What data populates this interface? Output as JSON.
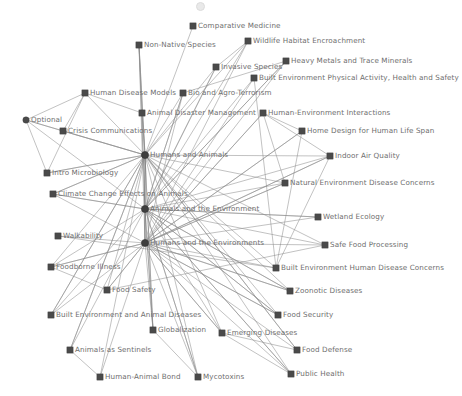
{
  "figure": {
    "type": "node-link-network-graph",
    "background_color": "#ffffff",
    "edge_color": "#8a8a8a",
    "node_color": "#4a4a4a",
    "label_color": "#6e6e6e",
    "width": 462,
    "height": 396
  },
  "chart_data": {
    "type": "network",
    "title": "",
    "hub_nodes": [
      "Humans and Animals",
      "Animals and the Environment",
      "Humans and the Environments"
    ],
    "nodes": [
      {
        "id": "comparative-medicine",
        "label": "Comparative Medicine",
        "x": 193,
        "y": 26,
        "shape": "square",
        "anchor": "right"
      },
      {
        "id": "non-native-species",
        "label": "Non-Native Species",
        "x": 139,
        "y": 45,
        "shape": "square",
        "anchor": "right"
      },
      {
        "id": "wildlife-habitat-encroachment",
        "label": "Wildlife Habitat Encroachment",
        "x": 248,
        "y": 41,
        "shape": "square",
        "anchor": "right"
      },
      {
        "id": "heavy-metals-trace-minerals",
        "label": "Heavy Metals and Trace Minerals",
        "x": 286,
        "y": 61,
        "shape": "square",
        "anchor": "right"
      },
      {
        "id": "invasive-species",
        "label": "Invasive Species",
        "x": 216,
        "y": 67,
        "shape": "square",
        "anchor": "right"
      },
      {
        "id": "built-env-physical-activity",
        "label": "Built Environment Physical Activity, Health and Safety",
        "x": 254,
        "y": 78,
        "shape": "square",
        "anchor": "right"
      },
      {
        "id": "human-disease-models",
        "label": "Human Disease Models",
        "x": 85,
        "y": 93,
        "shape": "square",
        "anchor": "right"
      },
      {
        "id": "bio-agro-terrorism",
        "label": "Bio and Agro-Terrorism",
        "x": 183,
        "y": 93,
        "shape": "square",
        "anchor": "right"
      },
      {
        "id": "animal-disaster-management",
        "label": "Animal Disaster Management",
        "x": 142,
        "y": 113,
        "shape": "square",
        "anchor": "right"
      },
      {
        "id": "human-environment-interactions",
        "label": "Human-Environment Interactions",
        "x": 263,
        "y": 113,
        "shape": "square",
        "anchor": "right"
      },
      {
        "id": "optional",
        "label": "Optional",
        "x": 26,
        "y": 120,
        "shape": "circle",
        "anchor": "right"
      },
      {
        "id": "crisis-communications",
        "label": "Crisis Communications",
        "x": 63,
        "y": 131,
        "shape": "square",
        "anchor": "right"
      },
      {
        "id": "home-design-human-life-span",
        "label": "Home Design for Human Life Span",
        "x": 302,
        "y": 131,
        "shape": "square",
        "anchor": "right"
      },
      {
        "id": "humans-and-animals",
        "label": "Humans and Animals",
        "x": 145,
        "y": 155,
        "shape": "hub",
        "anchor": "right"
      },
      {
        "id": "indoor-air-quality",
        "label": "Indoor Air Quality",
        "x": 330,
        "y": 156,
        "shape": "square",
        "anchor": "right"
      },
      {
        "id": "intro-microbiology",
        "label": "Intro Microbiology",
        "x": 47,
        "y": 173,
        "shape": "square",
        "anchor": "right"
      },
      {
        "id": "natural-env-disease-concerns",
        "label": "Natural Environment Disease Concerns",
        "x": 285,
        "y": 183,
        "shape": "square",
        "anchor": "right"
      },
      {
        "id": "climate-change-effects-animals",
        "label": "Climate Change Effects on Animals",
        "x": 53,
        "y": 194,
        "shape": "square",
        "anchor": "right"
      },
      {
        "id": "animals-and-the-environment",
        "label": "Animals and the Environment",
        "x": 145,
        "y": 209,
        "shape": "hub",
        "anchor": "right"
      },
      {
        "id": "wetland-ecology",
        "label": "Wetland Ecology",
        "x": 318,
        "y": 217,
        "shape": "square",
        "anchor": "right"
      },
      {
        "id": "walkability",
        "label": "Walkability",
        "x": 58,
        "y": 236,
        "shape": "square",
        "anchor": "right"
      },
      {
        "id": "humans-and-the-environments",
        "label": "Humans and the Environments",
        "x": 145,
        "y": 243,
        "shape": "hub",
        "anchor": "right"
      },
      {
        "id": "safe-food-processing",
        "label": "Safe Food Processing",
        "x": 325,
        "y": 245,
        "shape": "square",
        "anchor": "right"
      },
      {
        "id": "foodborne-illness",
        "label": "Foodborne Illness",
        "x": 51,
        "y": 267,
        "shape": "square",
        "anchor": "right"
      },
      {
        "id": "built-env-human-disease-concerns",
        "label": "Built Environment Human Disease Concerns",
        "x": 276,
        "y": 268,
        "shape": "square",
        "anchor": "right"
      },
      {
        "id": "food-safety",
        "label": "Food Safety",
        "x": 107,
        "y": 290,
        "shape": "square",
        "anchor": "right"
      },
      {
        "id": "zoonotic-diseases",
        "label": "Zoonotic Diseases",
        "x": 290,
        "y": 291,
        "shape": "square",
        "anchor": "right"
      },
      {
        "id": "built-env-animal-diseases",
        "label": "Built Environment and Animal Diseases",
        "x": 51,
        "y": 315,
        "shape": "square",
        "anchor": "right"
      },
      {
        "id": "food-security",
        "label": "Food Security",
        "x": 278,
        "y": 315,
        "shape": "square",
        "anchor": "right"
      },
      {
        "id": "globalization",
        "label": "Globalization",
        "x": 153,
        "y": 330,
        "shape": "square",
        "anchor": "right"
      },
      {
        "id": "emerging-diseases",
        "label": "Emerging Diseases",
        "x": 222,
        "y": 333,
        "shape": "square",
        "anchor": "right"
      },
      {
        "id": "food-defense",
        "label": "Food Defense",
        "x": 297,
        "y": 350,
        "shape": "square",
        "anchor": "right"
      },
      {
        "id": "animals-as-sentinels",
        "label": "Animals as Sentinels",
        "x": 70,
        "y": 350,
        "shape": "square",
        "anchor": "right"
      },
      {
        "id": "public-health",
        "label": "Public Health",
        "x": 291,
        "y": 374,
        "shape": "square",
        "anchor": "right"
      },
      {
        "id": "human-animal-bond",
        "label": "Human-Animal Bond",
        "x": 100,
        "y": 377,
        "shape": "square",
        "anchor": "right"
      },
      {
        "id": "mycotoxins",
        "label": "Mycotoxins",
        "x": 198,
        "y": 377,
        "shape": "square",
        "anchor": "right"
      }
    ],
    "edges": [
      [
        "humans-and-animals",
        "comparative-medicine"
      ],
      [
        "humans-and-animals",
        "non-native-species"
      ],
      [
        "humans-and-animals",
        "wildlife-habitat-encroachment"
      ],
      [
        "humans-and-animals",
        "invasive-species"
      ],
      [
        "humans-and-animals",
        "bio-agro-terrorism"
      ],
      [
        "humans-and-animals",
        "animal-disaster-management"
      ],
      [
        "humans-and-animals",
        "human-disease-models"
      ],
      [
        "humans-and-animals",
        "crisis-communications"
      ],
      [
        "humans-and-animals",
        "intro-microbiology"
      ],
      [
        "humans-and-animals",
        "climate-change-effects-animals"
      ],
      [
        "humans-and-animals",
        "zoonotic-diseases"
      ],
      [
        "humans-and-animals",
        "emerging-diseases"
      ],
      [
        "humans-and-animals",
        "public-health"
      ],
      [
        "humans-and-animals",
        "food-safety"
      ],
      [
        "humans-and-animals",
        "food-security"
      ],
      [
        "humans-and-animals",
        "food-defense"
      ],
      [
        "humans-and-animals",
        "animals-as-sentinels"
      ],
      [
        "humans-and-animals",
        "human-animal-bond"
      ],
      [
        "humans-and-animals",
        "mycotoxins"
      ],
      [
        "humans-and-animals",
        "globalization"
      ],
      [
        "humans-and-animals",
        "foodborne-illness"
      ],
      [
        "humans-and-animals",
        "safe-food-processing"
      ],
      [
        "humans-and-animals",
        "built-env-animal-diseases"
      ],
      [
        "animals-and-the-environment",
        "non-native-species"
      ],
      [
        "animals-and-the-environment",
        "invasive-species"
      ],
      [
        "animals-and-the-environment",
        "wildlife-habitat-encroachment"
      ],
      [
        "animals-and-the-environment",
        "heavy-metals-trace-minerals"
      ],
      [
        "animals-and-the-environment",
        "climate-change-effects-animals"
      ],
      [
        "animals-and-the-environment",
        "wetland-ecology"
      ],
      [
        "animals-and-the-environment",
        "natural-env-disease-concerns"
      ],
      [
        "animals-and-the-environment",
        "built-env-animal-diseases"
      ],
      [
        "animals-and-the-environment",
        "animals-as-sentinels"
      ],
      [
        "animals-and-the-environment",
        "globalization"
      ],
      [
        "animals-and-the-environment",
        "emerging-diseases"
      ],
      [
        "animals-and-the-environment",
        "zoonotic-diseases"
      ],
      [
        "animals-and-the-environment",
        "public-health"
      ],
      [
        "animals-and-the-environment",
        "food-security"
      ],
      [
        "animals-and-the-environment",
        "mycotoxins"
      ],
      [
        "animals-and-the-environment",
        "safe-food-processing"
      ],
      [
        "animals-and-the-environment",
        "bio-agro-terrorism"
      ],
      [
        "humans-and-the-environments",
        "human-environment-interactions"
      ],
      [
        "humans-and-the-environments",
        "home-design-human-life-span"
      ],
      [
        "humans-and-the-environments",
        "indoor-air-quality"
      ],
      [
        "humans-and-the-environments",
        "natural-env-disease-concerns"
      ],
      [
        "humans-and-the-environments",
        "built-env-physical-activity"
      ],
      [
        "humans-and-the-environments",
        "built-env-human-disease-concerns"
      ],
      [
        "humans-and-the-environments",
        "walkability"
      ],
      [
        "humans-and-the-environments",
        "foodborne-illness"
      ],
      [
        "humans-and-the-environments",
        "food-safety"
      ],
      [
        "humans-and-the-environments",
        "built-env-animal-diseases"
      ],
      [
        "humans-and-the-environments",
        "globalization"
      ],
      [
        "humans-and-the-environments",
        "emerging-diseases"
      ],
      [
        "humans-and-the-environments",
        "food-security"
      ],
      [
        "humans-and-the-environments",
        "food-defense"
      ],
      [
        "humans-and-the-environments",
        "public-health"
      ],
      [
        "humans-and-the-environments",
        "safe-food-processing"
      ],
      [
        "humans-and-the-environments",
        "wetland-ecology"
      ],
      [
        "humans-and-the-environments",
        "zoonotic-diseases"
      ],
      [
        "humans-and-the-environments",
        "mycotoxins"
      ],
      [
        "humans-and-the-environments",
        "heavy-metals-trace-minerals"
      ],
      [
        "optional",
        "human-disease-models"
      ],
      [
        "optional",
        "crisis-communications"
      ],
      [
        "optional",
        "intro-microbiology"
      ],
      [
        "human-disease-models",
        "crisis-communications"
      ],
      [
        "human-disease-models",
        "animal-disaster-management"
      ],
      [
        "human-disease-models",
        "intro-microbiology"
      ],
      [
        "human-environment-interactions",
        "home-design-human-life-span"
      ],
      [
        "human-environment-interactions",
        "indoor-air-quality"
      ],
      [
        "human-environment-interactions",
        "natural-env-disease-concerns"
      ],
      [
        "built-env-physical-activity",
        "built-env-human-disease-concerns"
      ],
      [
        "home-design-human-life-span",
        "built-env-human-disease-concerns"
      ],
      [
        "indoor-air-quality",
        "built-env-human-disease-concerns"
      ],
      [
        "walkability",
        "built-env-human-disease-concerns"
      ],
      [
        "foodborne-illness",
        "food-safety"
      ],
      [
        "food-safety",
        "safe-food-processing"
      ],
      [
        "animals-as-sentinels",
        "human-animal-bond"
      ],
      [
        "globalization",
        "mycotoxins"
      ],
      [
        "emerging-diseases",
        "public-health"
      ],
      [
        "emerging-diseases",
        "food-defense"
      ],
      [
        "non-native-species",
        "animal-disaster-management"
      ],
      [
        "invasive-species",
        "wildlife-habitat-encroachment"
      ],
      [
        "bio-agro-terrorism",
        "heavy-metals-trace-minerals"
      ]
    ]
  }
}
